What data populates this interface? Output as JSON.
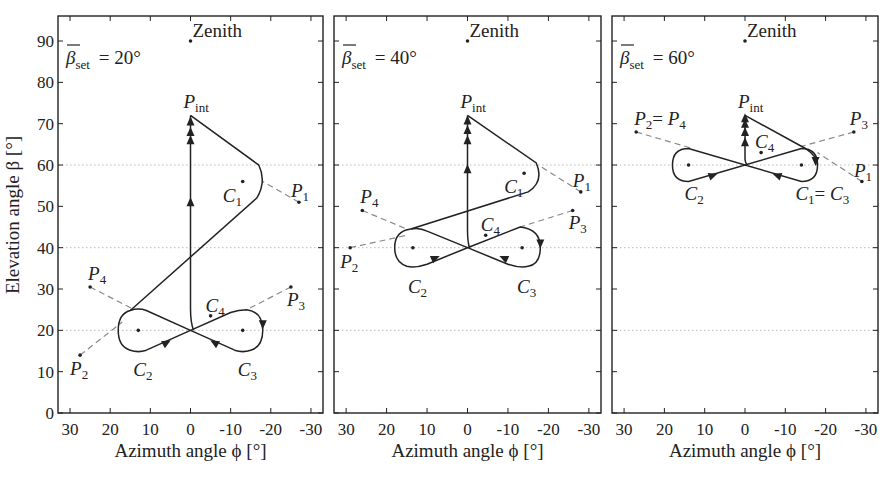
{
  "figure": {
    "y_axis_label": "Elevation angle β [°]",
    "x_axis_label": "Azimuth angle ϕ [°]",
    "y_ticks": [
      "0",
      "10",
      "20",
      "30",
      "40",
      "50",
      "60",
      "70",
      "80",
      "90"
    ],
    "x_ticks": [
      "30",
      "20",
      "10",
      "0",
      "-10",
      "-20",
      "-30"
    ]
  },
  "panels": [
    {
      "title": "β̄set = 20°",
      "beta_set": "20°",
      "zenith_label": "Zenith",
      "labels": {
        "Pint": "P",
        "P1": "P",
        "P2": "P",
        "P3": "P",
        "P4": "P",
        "C1": "C",
        "C2": "C",
        "C3": "C",
        "C4": "C"
      },
      "points": {
        "zenith": [
          0,
          90
        ],
        "P_int": [
          0,
          72
        ],
        "P1": [
          -27,
          51
        ],
        "P2": [
          27.5,
          14
        ],
        "P3": [
          -25,
          30.5
        ],
        "P4": [
          25,
          30.5
        ],
        "C1": [
          -13,
          56
        ],
        "C2": [
          13,
          20
        ],
        "C3": [
          -13,
          20
        ],
        "C4": [
          -5,
          23.5
        ]
      }
    },
    {
      "title": "β̄set = 40°",
      "beta_set": "40°",
      "zenith_label": "Zenith",
      "points": {
        "zenith": [
          0,
          90
        ],
        "P_int": [
          0,
          72
        ],
        "P1": [
          -28,
          53.5
        ],
        "P2": [
          29,
          40
        ],
        "P3": [
          -26,
          49
        ],
        "P4": [
          26,
          49
        ],
        "C1": [
          -14,
          58
        ],
        "C2": [
          13.5,
          40
        ],
        "C3": [
          -13.5,
          40
        ],
        "C4": [
          -4.5,
          43
        ]
      }
    },
    {
      "title": "β̄set = 60°",
      "beta_set": "60°",
      "zenith_label": "Zenith",
      "points": {
        "zenith": [
          0,
          90
        ],
        "P_int": [
          0,
          72
        ],
        "P1": [
          -29,
          56
        ],
        "P2=P4": [
          27,
          68
        ],
        "P3": [
          -27,
          68
        ],
        "C1=C3": [
          -14,
          60
        ],
        "C2": [
          14,
          60
        ],
        "C4": [
          -4,
          63
        ]
      },
      "label_p2p4": "P2= P4",
      "label_c1c3": "C1= C3"
    }
  ],
  "text": {
    "zenith": "Zenith",
    "beta_set_prefix": "β",
    "beta_set_sub": "set",
    "p": "P",
    "c": "C",
    "int": "int",
    "eq": "=",
    "panel_values": [
      "= 20°",
      "= 40°",
      "= 60°"
    ]
  },
  "colors": {
    "ink": "#222222",
    "grid": "#bbbbbb",
    "dashed": "#888888"
  }
}
